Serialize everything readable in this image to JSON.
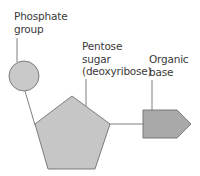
{
  "diagram": {
    "type": "nucleotide-structure",
    "labels": {
      "phosphate": [
        "Phosphate",
        "group"
      ],
      "pentose": [
        "Pentose",
        "sugar",
        "(deoxyribose)"
      ],
      "base": [
        "Organic",
        "base"
      ]
    },
    "colors": {
      "phosphate_fill": "#c9c9c9",
      "sugar_fill": "#c6c6c6",
      "base_fill": "#a9a9a9",
      "stroke": "#707070",
      "text": "#3a3a3a"
    }
  }
}
